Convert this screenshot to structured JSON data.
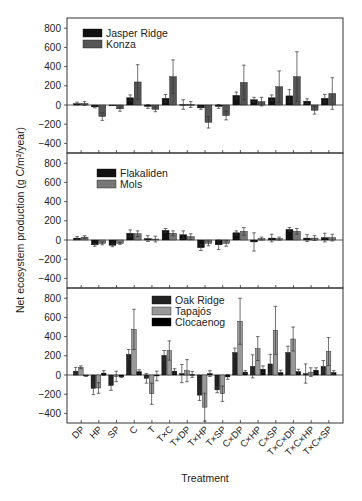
{
  "chart_data": {
    "type": "bar",
    "xlabel": "Treatment",
    "ylabel": "Net ecosystem production (g C/m²/year)",
    "ylim": [
      -500,
      880
    ],
    "yticks": [
      800,
      600,
      400,
      200,
      0,
      -200,
      -400
    ],
    "categories": [
      "DP",
      "HP",
      "SP",
      "C",
      "T",
      "T×C",
      "T×DP",
      "T×HP",
      "T×SP",
      "C×DP",
      "C×HP",
      "C×SP",
      "T×C×DP",
      "T×C×HP",
      "T×C×SP"
    ],
    "panels": [
      {
        "series": [
          {
            "name": "Jasper Ridge",
            "color": "#111111",
            "values": [
              15,
              -20,
              0,
              75,
              -15,
              70,
              5,
              -30,
              -15,
              100,
              55,
              75,
              95,
              40,
              70
            ],
            "errors": [
              15,
              10,
              0,
              30,
              20,
              40,
              50,
              15,
              20,
              35,
              25,
              30,
              65,
              25,
              40
            ]
          },
          {
            "name": "Konza",
            "color": "#555555",
            "values": [
              15,
              -120,
              -40,
              240,
              -45,
              295,
              5,
              -180,
              -110,
              235,
              35,
              190,
              295,
              -55,
              120
            ],
            "errors": [
              20,
              40,
              25,
              180,
              25,
              175,
              30,
              60,
              45,
              180,
              45,
              165,
              260,
              40,
              165
            ]
          }
        ]
      },
      {
        "series": [
          {
            "name": "Flakaliden",
            "color": "#111111",
            "values": [
              20,
              -50,
              -55,
              70,
              15,
              100,
              55,
              -80,
              -50,
              75,
              -20,
              20,
              110,
              20,
              25
            ],
            "errors": [
              15,
              15,
              15,
              35,
              30,
              20,
              40,
              30,
              50,
              20,
              95,
              40,
              20,
              35,
              45
            ]
          },
          {
            "name": "Mols",
            "color": "#777777",
            "values": [
              30,
              -35,
              -35,
              65,
              10,
              70,
              35,
              -35,
              -35,
              90,
              15,
              15,
              90,
              20,
              25
            ],
            "errors": [
              15,
              15,
              10,
              30,
              30,
              25,
              30,
              25,
              30,
              40,
              15,
              15,
              30,
              25,
              35
            ]
          }
        ]
      },
      {
        "series": [
          {
            "name": "Oak Ridge",
            "color": "#222222",
            "values": [
              40,
              -140,
              -110,
              215,
              -35,
              205,
              15,
              -210,
              -155,
              235,
              90,
              115,
              235,
              15,
              90
            ],
            "errors": [
              40,
              65,
              50,
              50,
              50,
              50,
              95,
              55,
              30,
              45,
              120,
              100,
              65,
              100,
              60
            ]
          },
          {
            "name": "Tapajós",
            "color": "#999999",
            "values": [
              80,
              -135,
              -15,
              475,
              -195,
              255,
              45,
              -335,
              -195,
              560,
              275,
              465,
              375,
              30,
              245
            ],
            "errors": [
              15,
              55,
              55,
              210,
              110,
              100,
              115,
              145,
              80,
              240,
              125,
              250,
              125,
              45,
              145
            ]
          },
          {
            "name": "Clocaenog",
            "color": "#000000",
            "values": [
              -10,
              20,
              -20,
              35,
              -10,
              40,
              5,
              15,
              -20,
              30,
              60,
              25,
              35,
              50,
              25
            ],
            "errors": [
              5,
              25,
              5,
              20,
              50,
              25,
              30,
              30,
              25,
              15,
              35,
              25,
              25,
              25,
              20
            ]
          }
        ]
      }
    ]
  },
  "legend": [
    [
      "Jasper Ridge",
      "Konza"
    ],
    [
      "Flakaliden",
      "Mols"
    ],
    [
      "Oak Ridge",
      "Tapajós",
      "Clocaenog"
    ]
  ]
}
